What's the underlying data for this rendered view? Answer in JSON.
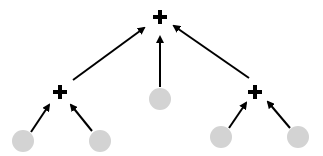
{
  "diagram": {
    "type": "tree",
    "colors": {
      "node": "#d3d3d3",
      "edge": "#000000",
      "operator": "#000000"
    },
    "nodes": [
      {
        "id": "root",
        "kind": "operator",
        "symbol": "+",
        "x": 160,
        "y": 17
      },
      {
        "id": "left-op",
        "kind": "operator",
        "symbol": "+",
        "x": 60,
        "y": 92
      },
      {
        "id": "right-op",
        "kind": "operator",
        "symbol": "+",
        "x": 255,
        "y": 92
      },
      {
        "id": "center-leaf",
        "kind": "leaf",
        "x": 160,
        "y": 98
      },
      {
        "id": "leaf-1",
        "kind": "leaf",
        "x": 23,
        "y": 141
      },
      {
        "id": "leaf-2",
        "kind": "leaf",
        "x": 100,
        "y": 141
      },
      {
        "id": "leaf-3",
        "kind": "leaf",
        "x": 221,
        "y": 137
      },
      {
        "id": "leaf-4",
        "kind": "leaf",
        "x": 298,
        "y": 137
      }
    ],
    "edges": [
      {
        "from": "left-op",
        "to": "root"
      },
      {
        "from": "center-leaf",
        "to": "root"
      },
      {
        "from": "right-op",
        "to": "root"
      },
      {
        "from": "leaf-1",
        "to": "left-op"
      },
      {
        "from": "leaf-2",
        "to": "left-op"
      },
      {
        "from": "leaf-3",
        "to": "right-op"
      },
      {
        "from": "leaf-4",
        "to": "right-op"
      }
    ]
  }
}
